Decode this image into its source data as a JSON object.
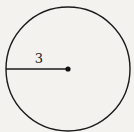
{
  "diagram": {
    "shape": "circle",
    "radius_label": "3",
    "colors": {
      "stroke": "#1a1a1a",
      "background": "#f3f2ef"
    }
  }
}
